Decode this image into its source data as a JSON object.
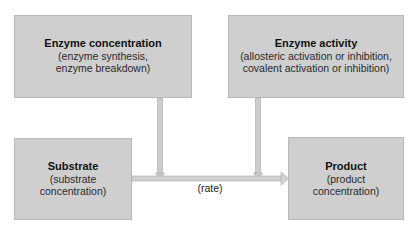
{
  "diagram": {
    "type": "flow",
    "boxes": {
      "enzyme_concentration": {
        "title": "Enzyme concentration",
        "line1": "(enzyme synthesis,",
        "line2": "enzyme breakdown)"
      },
      "enzyme_activity": {
        "title": "Enzyme activity",
        "line1": "(allosteric activation or inhibition,",
        "line2": "covalent activation or inhibition)"
      },
      "substrate": {
        "title": "Substrate",
        "line1": "(substrate",
        "line2": "concentration)"
      },
      "product": {
        "title": "Product",
        "line1": "(product",
        "line2": "concentration)"
      }
    },
    "edges": [
      {
        "from": "substrate",
        "to": "product",
        "label": "(rate)"
      },
      {
        "from": "enzyme_concentration",
        "to": "substrate->product"
      },
      {
        "from": "enzyme_activity",
        "to": "substrate->product"
      }
    ],
    "rate_label": "(rate)",
    "colors": {
      "box_fill": "#cfcfcf",
      "box_border": "#b8b8b8",
      "arrow": "#c4c4c4",
      "arrow_edge": "#a8a8a8"
    }
  }
}
